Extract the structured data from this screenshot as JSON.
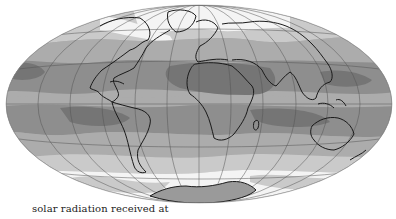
{
  "figure": {
    "caption": "solar radiation received at",
    "projection": "equal-area elliptical world map",
    "colors": {
      "band_lightest": "#f4f4f4",
      "band_light": "#cacaca",
      "band_medium": "#acacac",
      "band_dark": "#8e8e8e",
      "band_darkest": "#757575",
      "coastline": "#1a1a1a",
      "graticule": "#555555"
    }
  }
}
